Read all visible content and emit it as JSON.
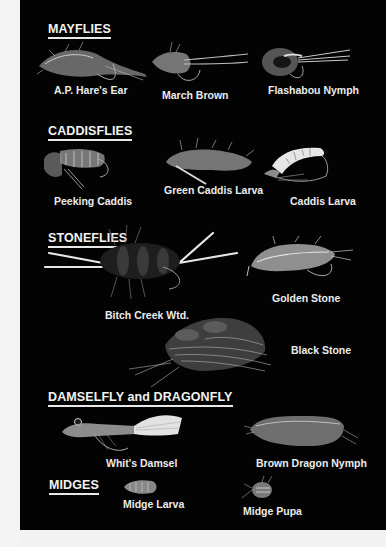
{
  "sections": {
    "mayflies": {
      "title": "MAYFLIES",
      "flies": [
        "A.P. Hare's Ear",
        "March Brown",
        "Flashabou Nymph"
      ]
    },
    "caddisflies": {
      "title": "CADDISFLIES",
      "flies": [
        "Peeking Caddis",
        "Green Caddis Larva",
        "Caddis Larva"
      ]
    },
    "stoneflies": {
      "title": "STONEFLIES",
      "flies": [
        "Bitch Creek Wtd.",
        "Golden Stone",
        "Black Stone"
      ]
    },
    "damsel_dragon": {
      "title": "DAMSELFLY and DRAGONFLY",
      "flies": [
        "Whit's Damsel",
        "Brown Dragon Nymph"
      ]
    },
    "midges": {
      "title": "MIDGES",
      "flies": [
        "Midge Larva",
        "Midge Pupa"
      ]
    }
  },
  "colors": {
    "panel_background": "#030303",
    "page_background": "#f4f4f4",
    "text": "#ececec"
  }
}
